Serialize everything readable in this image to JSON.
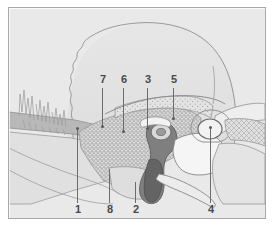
{
  "figure": {
    "kind": "anatomical-cross-section-diagram",
    "frame": {
      "border_color": "#a9a9a9",
      "background_color": "#e9e9e9",
      "page_background_color": "#ffffff"
    },
    "palette": {
      "outline": "#8d8d8d",
      "dark_outline": "#6d6d6d",
      "label_text": "#4a4a4a",
      "leader_line": "#6d6d6d",
      "bone_light": "#e3e3e3",
      "bone_mid": "#d4d4d4",
      "bone_shade": "#c6c6c6",
      "band_gray": "#b4b4b4",
      "cavity_white": "#f4f4f4",
      "structure_dark": "#7a7a7a",
      "structure_darkest": "#5e5e5e",
      "stipple": "#9b9b9b"
    }
  },
  "labels": {
    "top_row": [
      {
        "id": "label-7",
        "text": "7",
        "x": 97,
        "y": 74,
        "line_x": 101,
        "line_top": 87,
        "line_bottom": 126
      },
      {
        "id": "label-6",
        "text": "6",
        "x": 118,
        "y": 74,
        "line_x": 122,
        "line_top": 87,
        "line_bottom": 131
      },
      {
        "id": "label-3",
        "text": "3",
        "x": 142,
        "y": 74,
        "line_x": 146,
        "line_top": 87,
        "line_bottom": 128
      },
      {
        "id": "label-5",
        "text": "5",
        "x": 169,
        "y": 74,
        "line_x": 172,
        "line_top": 87,
        "line_bottom": 118
      }
    ],
    "bottom_row": [
      {
        "id": "label-1",
        "text": "1",
        "x": 72,
        "y": 204,
        "line_x": 76,
        "line_top": 127,
        "line_bottom": 202
      },
      {
        "id": "label-8",
        "text": "8",
        "x": 104,
        "y": 204,
        "line_x": 108,
        "line_top": 168,
        "line_bottom": 202
      },
      {
        "id": "label-2",
        "text": "2",
        "x": 130,
        "y": 204,
        "line_x": 134,
        "line_top": 181,
        "line_bottom": 202
      },
      {
        "id": "label-4",
        "text": "4",
        "x": 205,
        "y": 204,
        "line_x": 209,
        "line_top": 126,
        "line_bottom": 202
      }
    ]
  },
  "regions": [
    {
      "name": "cranial-vault",
      "description": "large domed skull outline with wavy suture along its left margin"
    },
    {
      "name": "zygomatic-arch-band",
      "description": "horizontal gray band crossing the left half of the section"
    },
    {
      "name": "cancellous-bone",
      "description": "dense stippled trabecular bone block below the labels 7, 6, 3"
    },
    {
      "name": "tympanic-bulla",
      "description": "oval cavity on the right indicated by label 4"
    },
    {
      "name": "auditory-canal",
      "description": "dark curved canal structure at center indicated by label 2 area"
    },
    {
      "name": "mandible-ramus",
      "description": "elongated tapered process extending to the lower right"
    },
    {
      "name": "hatched-bone-plate",
      "description": "cross-hatched bone plate to the right of the bulla"
    }
  ]
}
